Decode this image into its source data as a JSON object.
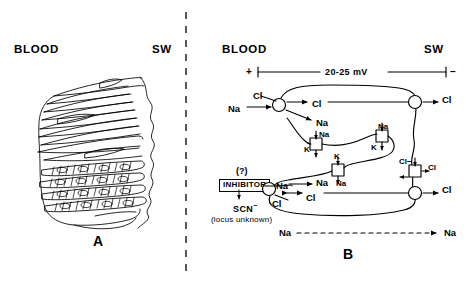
{
  "figure": {
    "divider": "vertical-dashed-separator",
    "panels": [
      {
        "id": "A",
        "letter": "A",
        "left_header": "BLOOD",
        "right_header": "SW",
        "caption": "hand-drawn sketch of stacked gill lamellae / epithelial cell layers"
      },
      {
        "id": "B",
        "letter": "B",
        "left_header": "BLOOD",
        "right_header": "SW",
        "voltage": {
          "plus": "+",
          "value": "20-25 mV",
          "minus": "−"
        },
        "inhibitor": {
          "question": "(?)",
          "box_label": "INHIBITOR",
          "agent": "SCN",
          "agent_charge": "−",
          "note": "(locus unknown)"
        },
        "upper_carrier": {
          "in_top": "Cl",
          "in_bottom": "Na",
          "out_top": "Cl",
          "out_bottom": "Na"
        },
        "lower_carrier": {
          "in_top": "Na",
          "in_bottom": "Cl",
          "out_top": "Na",
          "out_bottom": "Cl"
        },
        "pumps": [
          {
            "top": "Na",
            "bottom": "K"
          },
          {
            "top": "Na",
            "bottom": "K"
          },
          {
            "top": "K",
            "bottom": "Na"
          }
        ],
        "sw_channels": [
          {
            "label": "Cl"
          },
          {
            "label": "Cl"
          }
        ],
        "sw_exchanger": {
          "left": "Cl−",
          "right": "Cl"
        },
        "paracellular": {
          "left": "Na",
          "right": "Na",
          "style": "dashed-arrow"
        }
      }
    ]
  }
}
